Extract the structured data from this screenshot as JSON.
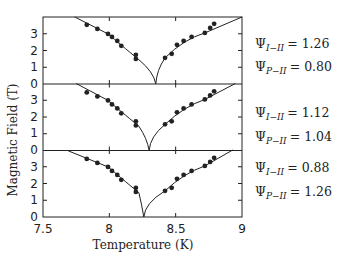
{
  "chart_data": {
    "type": "scatter",
    "xlabel": "Temperature (K)",
    "ylabel": "Magnetic Field (T)",
    "xlim": [
      7.5,
      9.0
    ],
    "xticks": [
      "7.5",
      "8",
      "8.5",
      "9"
    ],
    "yticks": [
      "0",
      "1",
      "2",
      "3"
    ],
    "grid": false,
    "panels": [
      {
        "name": "top",
        "ylim": [
          0,
          4
        ],
        "cusp_T": 8.35,
        "labels": [
          {
            "sym": "Ψ",
            "sub": "I−II",
            "value": "1.26"
          },
          {
            "sym": "Ψ",
            "sub": "P−II",
            "value": "0.80"
          }
        ],
        "points_left": [
          [
            7.83,
            3.53
          ],
          [
            7.91,
            3.29
          ],
          [
            7.99,
            2.99
          ],
          [
            8.02,
            2.81
          ],
          [
            8.06,
            2.57
          ],
          [
            8.09,
            2.28
          ],
          [
            8.2,
            1.74
          ],
          [
            8.2,
            1.5
          ]
        ],
        "points_right": [
          [
            8.42,
            1.56
          ],
          [
            8.47,
            1.8
          ],
          [
            8.51,
            2.34
          ],
          [
            8.56,
            2.57
          ],
          [
            8.62,
            2.81
          ],
          [
            8.72,
            3.05
          ],
          [
            8.76,
            3.35
          ],
          [
            8.79,
            3.59
          ]
        ],
        "curve_left_start": [
          7.74,
          4.0
        ],
        "curve_right_end": [
          9.0,
          4.0
        ]
      },
      {
        "name": "middle",
        "ylim": [
          0,
          4
        ],
        "cusp_T": 8.3,
        "labels": [
          {
            "sym": "Ψ",
            "sub": "I−II",
            "value": "1.12"
          },
          {
            "sym": "Ψ",
            "sub": "P−II",
            "value": "1.04"
          }
        ],
        "points_left": [
          [
            7.83,
            3.47
          ],
          [
            7.91,
            3.23
          ],
          [
            7.99,
            2.99
          ],
          [
            8.02,
            2.75
          ],
          [
            8.06,
            2.51
          ],
          [
            8.09,
            2.22
          ],
          [
            8.2,
            1.74
          ],
          [
            8.2,
            1.5
          ]
        ],
        "points_right": [
          [
            8.42,
            1.56
          ],
          [
            8.47,
            1.74
          ],
          [
            8.51,
            2.28
          ],
          [
            8.56,
            2.51
          ],
          [
            8.62,
            2.75
          ],
          [
            8.72,
            3.05
          ],
          [
            8.76,
            3.29
          ],
          [
            8.79,
            3.53
          ]
        ],
        "curve_left_start": [
          7.75,
          4.0
        ],
        "curve_right_end": [
          8.95,
          4.0
        ]
      },
      {
        "name": "bottom",
        "ylim": [
          0,
          4
        ],
        "cusp_T": 8.26,
        "labels": [
          {
            "sym": "Ψ",
            "sub": "I−II",
            "value": "0.88"
          },
          {
            "sym": "Ψ",
            "sub": "P−II",
            "value": "1.26"
          }
        ],
        "points_left": [
          [
            7.83,
            3.47
          ],
          [
            7.91,
            3.23
          ],
          [
            7.99,
            2.99
          ],
          [
            8.02,
            2.75
          ],
          [
            8.06,
            2.51
          ],
          [
            8.09,
            2.22
          ],
          [
            8.2,
            1.74
          ],
          [
            8.2,
            1.5
          ]
        ],
        "points_right": [
          [
            8.42,
            1.56
          ],
          [
            8.47,
            1.74
          ],
          [
            8.51,
            2.28
          ],
          [
            8.56,
            2.51
          ],
          [
            8.62,
            2.75
          ],
          [
            8.72,
            3.05
          ],
          [
            8.76,
            3.29
          ],
          [
            8.79,
            3.53
          ]
        ],
        "curve_left_start": [
          7.69,
          3.95
        ],
        "curve_right_end": [
          8.93,
          4.0
        ]
      }
    ]
  },
  "labels": {
    "xlabel": "Temperature (K)",
    "ylabel": "Magnetic Field (T)",
    "x_ticks": [
      "7.5",
      "8",
      "8.5",
      "9"
    ],
    "y_ticks": [
      "0",
      "1",
      "2",
      "3"
    ],
    "panel1": {
      "l1_sym": "Ψ",
      "l1_sub": "I−II",
      "l1_val": "= 1.26",
      "l2_sym": "Ψ",
      "l2_sub": "P−II",
      "l2_val": "= 0.80"
    },
    "panel2": {
      "l1_sym": "Ψ",
      "l1_sub": "I−II",
      "l1_val": "= 1.12",
      "l2_sym": "Ψ",
      "l2_sub": "P−II",
      "l2_val": "= 1.04"
    },
    "panel3": {
      "l1_sym": "Ψ",
      "l1_sub": "I−II",
      "l1_val": "= 0.88",
      "l2_sym": "Ψ",
      "l2_sub": "P−II",
      "l2_val": "= 1.26"
    }
  },
  "colors": {
    "ink": "#222222",
    "background": "#ffffff"
  }
}
